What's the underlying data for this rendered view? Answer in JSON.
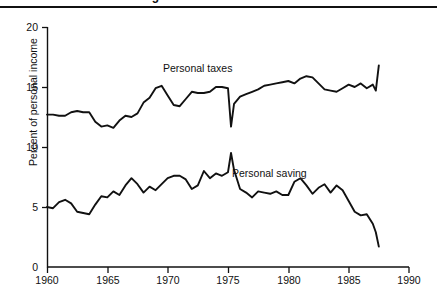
{
  "figure": {
    "title": "Personal taxes and savings",
    "title_clipped": true
  },
  "axes": {
    "ylabel": "Percent of personal income",
    "yticks": [
      "0",
      "5",
      "10",
      "15",
      "20"
    ],
    "xticks": [
      "1960",
      "1965",
      "1970",
      "1975",
      "1980",
      "1985",
      "1990"
    ]
  },
  "annotations": {
    "taxes_label": "Personal taxes",
    "saving_label": "Personal saving"
  },
  "colors": {
    "line": "#111111",
    "axis": "#111111",
    "background": "#ffffff"
  },
  "chart_data": {
    "type": "line",
    "title": "Personal taxes and savings",
    "xlabel": "",
    "ylabel": "Percent of personal income",
    "xlim": [
      1960,
      1990
    ],
    "ylim": [
      0,
      20
    ],
    "grid": false,
    "legend": "inline-annotations",
    "xticks": [
      1960,
      1965,
      1970,
      1975,
      1980,
      1985,
      1990
    ],
    "yticks": [
      0,
      5,
      10,
      15,
      20
    ],
    "series": [
      {
        "name": "Personal taxes",
        "annotation_text": "Personal taxes",
        "x": [
          1960.0,
          1960.5,
          1961.0,
          1961.5,
          1962.0,
          1962.5,
          1963.0,
          1963.5,
          1964.0,
          1964.5,
          1965.0,
          1965.5,
          1966.0,
          1966.5,
          1967.0,
          1967.5,
          1968.0,
          1968.5,
          1969.0,
          1969.5,
          1970.0,
          1970.5,
          1971.0,
          1971.5,
          1972.0,
          1972.5,
          1973.0,
          1973.5,
          1974.0,
          1974.5,
          1975.0,
          1975.25,
          1975.5,
          1976.0,
          1976.5,
          1977.0,
          1977.5,
          1978.0,
          1978.5,
          1979.0,
          1979.5,
          1980.0,
          1980.5,
          1981.0,
          1981.5,
          1982.0,
          1982.5,
          1983.0,
          1983.5,
          1984.0,
          1984.5,
          1985.0,
          1985.5,
          1986.0,
          1986.5,
          1987.0,
          1987.25,
          1987.5
        ],
        "y": [
          12.7,
          12.7,
          12.6,
          12.6,
          12.9,
          13.0,
          12.9,
          12.9,
          12.1,
          11.7,
          11.8,
          11.6,
          12.2,
          12.6,
          12.5,
          12.8,
          13.7,
          14.1,
          14.9,
          15.1,
          14.3,
          13.5,
          13.4,
          14.0,
          14.6,
          14.5,
          14.5,
          14.6,
          15.0,
          15.0,
          14.9,
          11.7,
          13.6,
          14.2,
          14.4,
          14.6,
          14.8,
          15.1,
          15.2,
          15.3,
          15.4,
          15.5,
          15.3,
          15.7,
          15.9,
          15.8,
          15.3,
          14.8,
          14.7,
          14.6,
          14.9,
          15.2,
          15.0,
          15.3,
          14.9,
          15.2,
          14.7,
          16.8
        ],
        "notes": "Sharp transitory drop to ~11.7 in mid-1975 (tax rebate); rises steeply to ~16.8 at series end."
      },
      {
        "name": "Personal saving",
        "annotation_text": "Personal saving",
        "x": [
          1960.0,
          1960.5,
          1961.0,
          1961.5,
          1962.0,
          1962.5,
          1963.0,
          1963.5,
          1964.0,
          1964.5,
          1965.0,
          1965.5,
          1966.0,
          1966.5,
          1967.0,
          1967.5,
          1968.0,
          1968.5,
          1969.0,
          1969.5,
          1970.0,
          1970.5,
          1971.0,
          1971.5,
          1972.0,
          1972.5,
          1973.0,
          1973.5,
          1974.0,
          1974.5,
          1975.0,
          1975.25,
          1975.5,
          1976.0,
          1976.5,
          1977.0,
          1977.5,
          1978.0,
          1978.5,
          1979.0,
          1979.5,
          1980.0,
          1980.5,
          1981.0,
          1981.5,
          1982.0,
          1982.5,
          1983.0,
          1983.5,
          1984.0,
          1984.5,
          1985.0,
          1985.5,
          1986.0,
          1986.5,
          1987.0,
          1987.25,
          1987.5
        ],
        "y": [
          5.0,
          4.9,
          5.4,
          5.6,
          5.3,
          4.6,
          4.5,
          4.4,
          5.2,
          5.9,
          5.8,
          6.3,
          6.0,
          6.8,
          7.4,
          6.9,
          6.2,
          6.7,
          6.4,
          6.9,
          7.4,
          7.6,
          7.6,
          7.3,
          6.5,
          6.8,
          8.0,
          7.4,
          7.8,
          7.6,
          7.9,
          9.5,
          8.1,
          6.5,
          6.2,
          5.8,
          6.3,
          6.2,
          6.1,
          6.3,
          6.0,
          6.0,
          7.1,
          7.4,
          6.8,
          6.1,
          6.6,
          6.9,
          6.2,
          6.8,
          6.4,
          5.5,
          4.6,
          4.3,
          4.4,
          3.6,
          2.9,
          1.7
        ],
        "notes": "Spike to ~9.5 in 1975; steady decline after 1984 to ~1.7 at series end."
      }
    ]
  },
  "geometry": {
    "plot_left_px": 47,
    "plot_right_px": 409,
    "y_top_px": 27,
    "y_bottom_px": 267
  }
}
